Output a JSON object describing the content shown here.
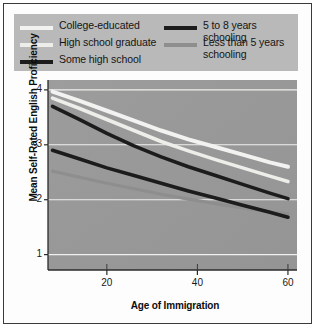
{
  "figure": {
    "background_color": "#ffffff",
    "plot_background_color": "#9a9a9a",
    "legend_background_color": "#b9b9b9",
    "frame_color": "#3a3a3a"
  },
  "chart_data": {
    "type": "line",
    "title": "",
    "xlabel": "Age of Immigration",
    "ylabel": "Mean Self-Rated English Proficiency",
    "xlim": [
      7,
      62
    ],
    "ylim": [
      0.72,
      4.18
    ],
    "xticks": [
      20,
      40,
      60
    ],
    "yticks": [
      1,
      2,
      3,
      4
    ],
    "xticklabels": [
      "20",
      "40",
      "60"
    ],
    "yticklabels": [
      "1",
      "2",
      "3",
      "4"
    ],
    "grid": "horizontal-white-gridlines",
    "legend_position": "above-plot",
    "x": [
      8,
      14,
      20,
      26,
      32,
      38,
      44,
      50,
      56,
      60
    ],
    "series": [
      {
        "name": "College-educated",
        "color": "#f2f2f0",
        "width": 4.0,
        "values": [
          3.97,
          3.8,
          3.62,
          3.44,
          3.26,
          3.1,
          2.96,
          2.82,
          2.68,
          2.6
        ]
      },
      {
        "name": "High school graduate",
        "color": "#ededea",
        "width": 3.6,
        "values": [
          3.85,
          3.66,
          3.46,
          3.26,
          3.06,
          2.89,
          2.73,
          2.58,
          2.43,
          2.33
        ]
      },
      {
        "name": "Some high school",
        "color": "#1c1c1c",
        "width": 3.6,
        "values": [
          3.7,
          3.46,
          3.21,
          2.98,
          2.78,
          2.6,
          2.44,
          2.28,
          2.12,
          2.02
        ]
      },
      {
        "name": "5 to 8 years schooling",
        "color": "#1c1c1c",
        "width": 3.6,
        "values": [
          2.9,
          2.74,
          2.58,
          2.44,
          2.3,
          2.16,
          2.03,
          1.9,
          1.77,
          1.68
        ]
      },
      {
        "name": "Less than 5 years schooling",
        "color": "#8e8e8e",
        "width": 3.2,
        "values": [
          2.52,
          2.41,
          2.3,
          2.2,
          2.1,
          2.01,
          1.93,
          1.85,
          1.78,
          1.74
        ]
      }
    ]
  },
  "legend": {
    "left_column": [
      {
        "label": "College-educated",
        "swatch_color": "#f2f2f0"
      },
      {
        "label": "High school graduate",
        "swatch_color": "#ededea"
      },
      {
        "label": "Some high school",
        "swatch_color": "#1c1c1c"
      }
    ],
    "right_column": [
      {
        "label": "5 to 8 years schooling",
        "swatch_color": "#1c1c1c"
      },
      {
        "label": "Less than 5 years schooling",
        "swatch_color": "#8e8e8e"
      }
    ]
  }
}
